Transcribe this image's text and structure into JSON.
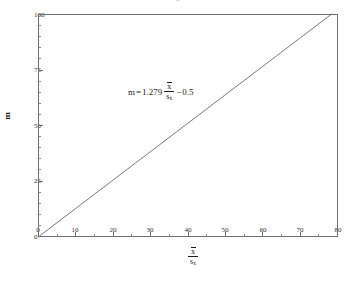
{
  "figure": {
    "title_remnant": "s",
    "title_remnant_sub": "x",
    "background_color": "#ffffff",
    "axis_color": "#6f6f6f",
    "line_color": "#555555",
    "text_color": "#1a1a1a"
  },
  "axes": {
    "x": {
      "label_numerator": "x",
      "label_denominator": "s",
      "label_denominator_sub": "x",
      "min": 0,
      "max": 80,
      "major_step": 10,
      "minor_step": 5,
      "tick_labels": [
        "0",
        "10",
        "20",
        "30",
        "40",
        "50",
        "60",
        "70",
        "80"
      ],
      "tick_values": [
        0,
        10,
        20,
        30,
        40,
        50,
        60,
        70,
        80
      ]
    },
    "y": {
      "label": "m",
      "min": 0,
      "max": 100,
      "major_step": 25,
      "minor_step": 5,
      "tick_labels": [
        "0",
        "25",
        "50",
        "75",
        "100"
      ],
      "tick_values": [
        0,
        25,
        50,
        75,
        100
      ]
    }
  },
  "annotation": {
    "lhs": "m",
    "equals": "=",
    "slope": "1.279",
    "frac_numerator": "x",
    "frac_denominator": "s",
    "frac_denominator_sub": "x",
    "minus": "−",
    "intercept": "0.5",
    "full_text": "m = 1.279 x̄/sₓ − 0.5"
  },
  "chart_data": {
    "type": "line",
    "title": "",
    "subtitle": "",
    "xlabel": "x̄ / sₓ",
    "ylabel": "m",
    "xlim": [
      0,
      80
    ],
    "ylim": [
      0,
      100
    ],
    "grid": false,
    "legend": null,
    "equation": "m = 1.279*(x̄/sₓ) - 0.5",
    "slope": 1.279,
    "intercept": -0.5,
    "series": [
      {
        "name": "m vs x̄/sₓ",
        "color": "#555555",
        "x": [
          0.391,
          10,
          20,
          30,
          40,
          50,
          60,
          70,
          78.577
        ],
        "y": [
          0,
          12.29,
          25.08,
          37.87,
          50.66,
          63.45,
          76.24,
          89.03,
          100
        ]
      }
    ],
    "annotations": [
      {
        "text": "m = 1.279 x̄/sₓ − 0.5",
        "x": 24,
        "y": 63
      }
    ]
  }
}
